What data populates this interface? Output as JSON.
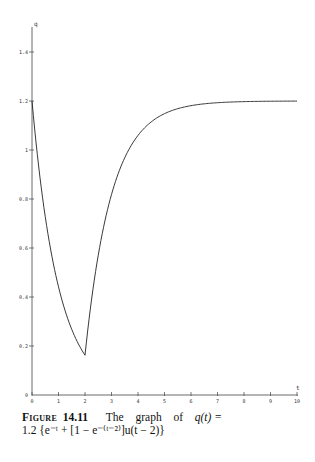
{
  "chart_data": {
    "type": "line",
    "title": "",
    "xlabel": "t",
    "ylabel": "q",
    "xlim": [
      0,
      10
    ],
    "ylim": [
      0,
      1.5
    ],
    "grid": false,
    "legend": null,
    "x_ticks": [
      "0",
      "1",
      "2",
      "3",
      "4",
      "5",
      "6",
      "7",
      "8",
      "9",
      "10"
    ],
    "y_ticks": [
      "0",
      "0.2",
      "0.4",
      "0.6",
      "0.8",
      "1",
      "1.2",
      "1.4"
    ],
    "series": [
      {
        "name": "q(t)",
        "x": [
          0,
          0.25,
          0.5,
          0.75,
          1,
          1.25,
          1.5,
          1.75,
          2,
          2.25,
          2.5,
          2.75,
          3,
          3.5,
          4,
          4.5,
          5,
          5.5,
          6,
          6.5,
          7,
          8,
          9,
          10
        ],
        "y": [
          1.2,
          0.935,
          0.728,
          0.567,
          0.441,
          0.344,
          0.268,
          0.209,
          0.162,
          0.392,
          0.571,
          0.71,
          0.818,
          0.969,
          1.06,
          1.115,
          1.148,
          1.169,
          1.181,
          1.189,
          1.193,
          1.197,
          1.199,
          1.2
        ]
      }
    ],
    "annotations": []
  },
  "caption": {
    "figure_label": "Figure",
    "figure_number": "14.11",
    "text_line1": [
      "The",
      "graph",
      "of"
    ],
    "formula_line1": "q(t) =",
    "formula_line2": "1.2 {e⁻ᵗ + [1 − e⁻⁽ᵗ⁻²⁾]u(t − 2)}"
  }
}
